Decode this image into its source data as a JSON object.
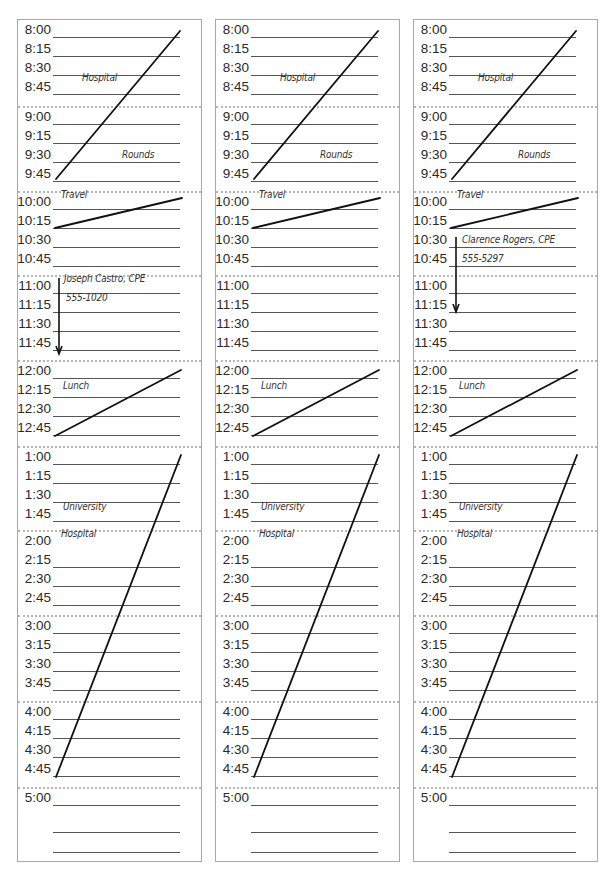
{
  "columns": [
    {
      "id": "day-1",
      "left": 17,
      "blocks": [
        {
          "hour": "8",
          "top": 0,
          "rows": [
            "8:00",
            "8:15",
            "8:30",
            "8:45"
          ]
        },
        {
          "hour": "9",
          "top": 86,
          "rows": [
            "9:00",
            "9:15",
            "9:30",
            "9:45"
          ]
        },
        {
          "hour": "10",
          "top": 171,
          "rows": [
            "10:00",
            "10:15",
            "10:30",
            "10:45"
          ]
        },
        {
          "hour": "11",
          "top": 255,
          "rows": [
            "11:00",
            "11:15",
            "11:30",
            "11:45"
          ]
        },
        {
          "hour": "12",
          "top": 340,
          "rows": [
            "12:00",
            "12:15",
            "12:30",
            "12:45"
          ]
        },
        {
          "hour": "1",
          "top": 426,
          "rows": [
            "1:00",
            "1:15",
            "1:30",
            "1:45"
          ]
        },
        {
          "hour": "2",
          "top": 510,
          "rows": [
            "2:00",
            "2:15",
            "2:30",
            "2:45"
          ]
        },
        {
          "hour": "3",
          "top": 595,
          "rows": [
            "3:00",
            "3:15",
            "3:30",
            "3:45"
          ]
        },
        {
          "hour": "4",
          "top": 681,
          "rows": [
            "4:00",
            "4:15",
            "4:30",
            "4:45"
          ]
        },
        {
          "hour": "5",
          "top": 767,
          "rows": [
            "5:00",
            "",
            ""
          ]
        }
      ],
      "notes": [
        {
          "text": "Hospital",
          "x": 64,
          "y": 63
        },
        {
          "text": "Rounds",
          "x": 104,
          "y": 140
        },
        {
          "text": "Travel",
          "x": 43,
          "y": 180
        },
        {
          "text": "Joseph Castro, CPE",
          "x": 46,
          "y": 264
        },
        {
          "text": "555-1020",
          "x": 48,
          "y": 283
        },
        {
          "text": "Lunch",
          "x": 45,
          "y": 371
        },
        {
          "text": "University",
          "x": 45,
          "y": 492
        },
        {
          "text": "Hospital",
          "x": 43,
          "y": 519
        }
      ],
      "lines": [
        {
          "x1": 162,
          "y1": 11,
          "x2": 38,
          "y2": 159
        },
        {
          "x1": 164,
          "y1": 178,
          "x2": 37,
          "y2": 208
        },
        {
          "x1": 163,
          "y1": 350,
          "x2": 37,
          "y2": 416
        },
        {
          "x1": 163,
          "y1": 435,
          "x2": 38,
          "y2": 757
        }
      ],
      "arrows": [
        {
          "x": 41,
          "y1": 258,
          "y2": 334
        }
      ]
    },
    {
      "id": "day-2",
      "left": 215,
      "blocks": [
        {
          "hour": "8",
          "top": 0,
          "rows": [
            "8:00",
            "8:15",
            "8:30",
            "8:45"
          ]
        },
        {
          "hour": "9",
          "top": 86,
          "rows": [
            "9:00",
            "9:15",
            "9:30",
            "9:45"
          ]
        },
        {
          "hour": "10",
          "top": 171,
          "rows": [
            "10:00",
            "10:15",
            "10:30",
            "10:45"
          ]
        },
        {
          "hour": "11",
          "top": 255,
          "rows": [
            "11:00",
            "11:15",
            "11:30",
            "11:45"
          ]
        },
        {
          "hour": "12",
          "top": 340,
          "rows": [
            "12:00",
            "12:15",
            "12:30",
            "12:45"
          ]
        },
        {
          "hour": "1",
          "top": 426,
          "rows": [
            "1:00",
            "1:15",
            "1:30",
            "1:45"
          ]
        },
        {
          "hour": "2",
          "top": 510,
          "rows": [
            "2:00",
            "2:15",
            "2:30",
            "2:45"
          ]
        },
        {
          "hour": "3",
          "top": 595,
          "rows": [
            "3:00",
            "3:15",
            "3:30",
            "3:45"
          ]
        },
        {
          "hour": "4",
          "top": 681,
          "rows": [
            "4:00",
            "4:15",
            "4:30",
            "4:45"
          ]
        },
        {
          "hour": "5",
          "top": 767,
          "rows": [
            "5:00",
            "",
            ""
          ]
        }
      ],
      "notes": [
        {
          "text": "Hospital",
          "x": 64,
          "y": 63
        },
        {
          "text": "Rounds",
          "x": 104,
          "y": 140
        },
        {
          "text": "Travel",
          "x": 43,
          "y": 180
        },
        {
          "text": "Lunch",
          "x": 45,
          "y": 371
        },
        {
          "text": "University",
          "x": 45,
          "y": 492
        },
        {
          "text": "Hospital",
          "x": 43,
          "y": 519
        }
      ],
      "lines": [
        {
          "x1": 162,
          "y1": 11,
          "x2": 38,
          "y2": 159
        },
        {
          "x1": 164,
          "y1": 178,
          "x2": 37,
          "y2": 208
        },
        {
          "x1": 163,
          "y1": 350,
          "x2": 37,
          "y2": 416
        },
        {
          "x1": 163,
          "y1": 435,
          "x2": 38,
          "y2": 757
        }
      ],
      "arrows": []
    },
    {
      "id": "day-3",
      "left": 413,
      "blocks": [
        {
          "hour": "8",
          "top": 0,
          "rows": [
            "8:00",
            "8:15",
            "8:30",
            "8:45"
          ]
        },
        {
          "hour": "9",
          "top": 86,
          "rows": [
            "9:00",
            "9:15",
            "9:30",
            "9:45"
          ]
        },
        {
          "hour": "10",
          "top": 171,
          "rows": [
            "10:00",
            "10:15",
            "10:30",
            "10:45"
          ]
        },
        {
          "hour": "11",
          "top": 255,
          "rows": [
            "11:00",
            "11:15",
            "11:30",
            "11:45"
          ]
        },
        {
          "hour": "12",
          "top": 340,
          "rows": [
            "12:00",
            "12:15",
            "12:30",
            "12:45"
          ]
        },
        {
          "hour": "1",
          "top": 426,
          "rows": [
            "1:00",
            "1:15",
            "1:30",
            "1:45"
          ]
        },
        {
          "hour": "2",
          "top": 510,
          "rows": [
            "2:00",
            "2:15",
            "2:30",
            "2:45"
          ]
        },
        {
          "hour": "3",
          "top": 595,
          "rows": [
            "3:00",
            "3:15",
            "3:30",
            "3:45"
          ]
        },
        {
          "hour": "4",
          "top": 681,
          "rows": [
            "4:00",
            "4:15",
            "4:30",
            "4:45"
          ]
        },
        {
          "hour": "5",
          "top": 767,
          "rows": [
            "5:00",
            "",
            ""
          ]
        }
      ],
      "notes": [
        {
          "text": "Hospital",
          "x": 64,
          "y": 63
        },
        {
          "text": "Rounds",
          "x": 104,
          "y": 140
        },
        {
          "text": "Travel",
          "x": 43,
          "y": 180
        },
        {
          "text": "Clarence Rogers, CPE",
          "x": 48,
          "y": 225
        },
        {
          "text": "555-5297",
          "x": 48,
          "y": 244
        },
        {
          "text": "Lunch",
          "x": 45,
          "y": 371
        },
        {
          "text": "University",
          "x": 45,
          "y": 492
        },
        {
          "text": "Hospital",
          "x": 43,
          "y": 519
        }
      ],
      "lines": [
        {
          "x1": 162,
          "y1": 11,
          "x2": 38,
          "y2": 159
        },
        {
          "x1": 164,
          "y1": 178,
          "x2": 37,
          "y2": 208
        },
        {
          "x1": 163,
          "y1": 350,
          "x2": 37,
          "y2": 416
        },
        {
          "x1": 163,
          "y1": 435,
          "x2": 38,
          "y2": 757
        }
      ],
      "arrows": [
        {
          "x": 42,
          "y1": 217,
          "y2": 292
        }
      ]
    }
  ],
  "style": {
    "border_color": "#a9a9a9",
    "divider_color": "#b5b5b5",
    "rule_color": "#555555",
    "ink_color": "#111111"
  },
  "hidden_rule_labels": [
    "2:00"
  ]
}
